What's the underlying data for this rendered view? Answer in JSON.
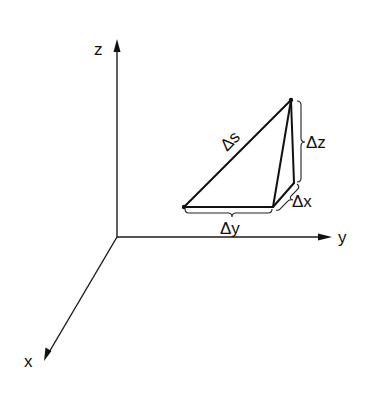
{
  "figure": {
    "axes": {
      "z": {
        "label": "z"
      },
      "y": {
        "label": "y"
      },
      "x": {
        "label": "x"
      }
    },
    "triangle": {
      "hypotenuse_label": "Δs",
      "dy_label": "Δy",
      "dz_label": "Δz",
      "dx_label": "Δx"
    }
  }
}
